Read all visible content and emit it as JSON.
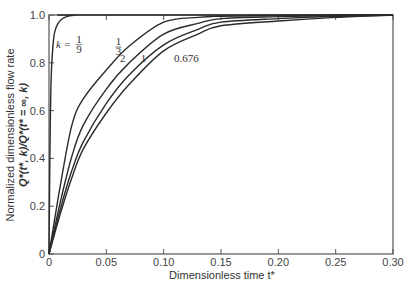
{
  "chart_data": {
    "type": "line",
    "title": "",
    "xlabel": "Dimensionless time t*",
    "ylabel_line1": "Normalized dimensionless flow rate",
    "ylabel_line2": "Q*(t*, k)/Q*(t* = ∞, k)",
    "xlim": [
      0,
      0.3
    ],
    "ylim": [
      0,
      1.0
    ],
    "grid": false,
    "legend_position": "inline labels",
    "x_ticks": [
      0,
      0.05,
      0.1,
      0.15,
      0.2,
      0.25,
      0.3
    ],
    "x_tick_labels": [
      "0",
      "0.05",
      "0.10",
      "0.15",
      "0.20",
      "0.25",
      "0.30"
    ],
    "y_ticks": [
      0,
      0.2,
      0.4,
      0.6,
      0.8,
      1.0
    ],
    "y_tick_labels": [
      "0",
      "0.2",
      "0.4",
      "0.6",
      "0.8",
      "1.0"
    ],
    "series": [
      {
        "name": "k = 1/9",
        "label": "k = 1/9",
        "x": [
          0,
          0.001,
          0.002,
          0.004,
          0.006,
          0.008,
          0.01,
          0.013,
          0.017,
          0.022,
          0.03,
          0.3
        ],
        "values": [
          0,
          0.5,
          0.75,
          0.9,
          0.945,
          0.965,
          0.978,
          0.988,
          0.995,
          0.999,
          1.0,
          1.0
        ]
      },
      {
        "name": "k = 1/3",
        "label": "1/3",
        "x": [
          0,
          0.01,
          0.02,
          0.03,
          0.05,
          0.07,
          0.1,
          0.13,
          0.15,
          0.2,
          0.25,
          0.3
        ],
        "values": [
          0,
          0.29,
          0.54,
          0.65,
          0.77,
          0.87,
          0.97,
          0.99,
          0.995,
          0.998,
          1.0,
          1.0
        ]
      },
      {
        "name": "k = 2",
        "label": "2",
        "x": [
          0,
          0.01,
          0.02,
          0.03,
          0.05,
          0.07,
          0.1,
          0.13,
          0.15,
          0.2,
          0.25,
          0.3
        ],
        "values": [
          0,
          0.22,
          0.41,
          0.54,
          0.69,
          0.8,
          0.92,
          0.965,
          0.985,
          0.993,
          0.998,
          1.0
        ]
      },
      {
        "name": "k = 1",
        "label": "1",
        "x": [
          0,
          0.01,
          0.02,
          0.03,
          0.05,
          0.07,
          0.1,
          0.13,
          0.15,
          0.2,
          0.25,
          0.3
        ],
        "values": [
          0,
          0.19,
          0.35,
          0.47,
          0.63,
          0.75,
          0.875,
          0.94,
          0.97,
          0.985,
          0.995,
          1.0
        ]
      },
      {
        "name": "k = 0.676",
        "label": "0.676",
        "x": [
          0,
          0.01,
          0.02,
          0.03,
          0.05,
          0.07,
          0.1,
          0.13,
          0.15,
          0.2,
          0.25,
          0.3
        ],
        "values": [
          0,
          0.17,
          0.32,
          0.44,
          0.59,
          0.71,
          0.85,
          0.92,
          0.955,
          0.975,
          0.99,
          1.0
        ]
      }
    ],
    "annotations": [
      {
        "text": "k = 1/9",
        "x": 0.006,
        "y": 0.88
      },
      {
        "text": "1/3",
        "x": 0.058,
        "y": 0.87
      },
      {
        "text": "2",
        "x": 0.062,
        "y": 0.82
      },
      {
        "text": "1",
        "x": 0.08,
        "y": 0.82
      },
      {
        "text": "0.676",
        "x": 0.109,
        "y": 0.82
      }
    ]
  }
}
